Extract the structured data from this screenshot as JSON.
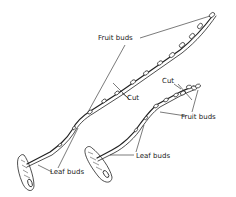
{
  "figure": {
    "colors": {
      "ink": "#222222",
      "background": "#ffffff"
    },
    "branches": [
      {
        "id": "long-branch",
        "labels": {
          "fruit_buds": "Fruit buds",
          "cut": "Cut",
          "leaf_buds": "Leaf buds"
        }
      },
      {
        "id": "short-branch",
        "labels": {
          "fruit_buds": "Fruit buds",
          "cut": "Cut",
          "leaf_buds": "Leaf buds"
        }
      }
    ]
  }
}
